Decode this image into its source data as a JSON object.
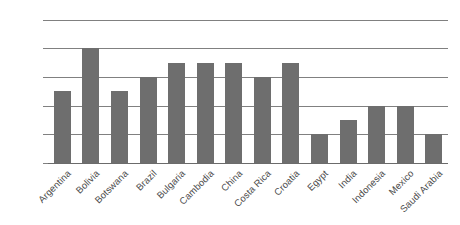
{
  "chart_data": {
    "type": "bar",
    "title": "",
    "xlabel": "",
    "ylabel": "",
    "categories": [
      "Argentina",
      "Bolivia",
      "Botswana",
      "Brazil",
      "Bulgaria",
      "Cambodia",
      "China",
      "Costa Rica",
      "Croatia",
      "Egypt",
      "India",
      "Indonesia",
      "Mexico",
      "Saudi Arabia"
    ],
    "values": [
      50,
      80,
      50,
      60,
      70,
      70,
      70,
      60,
      70,
      20,
      30,
      40,
      40,
      20
    ],
    "ylim": [
      0,
      100
    ],
    "y_ticks": [
      0,
      20,
      40,
      60,
      80,
      100
    ],
    "y_tick_labels": [
      "0%",
      "20%",
      "40%",
      "60%",
      "80%",
      "100%"
    ],
    "grid": true,
    "grid_axis": "y",
    "legend": false,
    "legend_position": "none",
    "value_unit": "%",
    "bar_color": "#6e6e6e",
    "gridline_color": "#808080",
    "axis_color": "#6b6b6b",
    "label_color": "#4a4a4a",
    "background_color": "#ffffff",
    "x_tick_label_rotation": -45
  }
}
